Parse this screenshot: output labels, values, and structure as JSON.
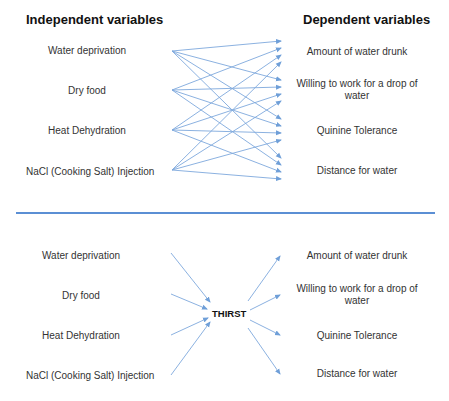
{
  "top": {
    "independent_header": "Independent variables",
    "dependent_header": "Dependent variables",
    "independent": [
      {
        "label": "Water deprivation"
      },
      {
        "label": "Dry food"
      },
      {
        "label": "Heat Dehydration"
      },
      {
        "label": "NaCl (Cooking Salt) Injection"
      }
    ],
    "dependent": [
      {
        "label": "Amount of water drunk"
      },
      {
        "label": "Willing to work for a drop of water"
      },
      {
        "label": "Quinine Tolerance"
      },
      {
        "label": "Distance for water"
      }
    ]
  },
  "bottom": {
    "independent": [
      {
        "label": "Water deprivation"
      },
      {
        "label": "Dry food"
      },
      {
        "label": "Heat Dehydration"
      },
      {
        "label": "NaCl (Cooking Salt) Injection"
      }
    ],
    "intervening": "THIRST",
    "dependent": [
      {
        "label": "Amount of water drunk"
      },
      {
        "label": "Willing to work for a drop of water"
      },
      {
        "label": "Quinine Tolerance"
      },
      {
        "label": "Distance for water"
      }
    ]
  },
  "colors": {
    "arrow": "#6f9fd8",
    "divider": "#5b8fd4"
  }
}
